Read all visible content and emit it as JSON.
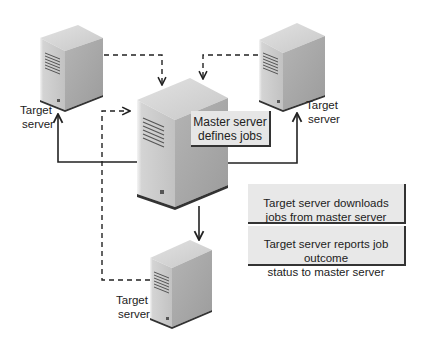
{
  "diagram": {
    "nodes": [
      {
        "id": "target-top-left",
        "label_line1": "Target",
        "label_line2": "server"
      },
      {
        "id": "target-top-right",
        "label_line1": "Target",
        "label_line2": "server"
      },
      {
        "id": "master",
        "callout_line1": "Master server",
        "callout_line2": "defines jobs"
      },
      {
        "id": "target-bottom",
        "label_line1": "Target",
        "label_line2": "server"
      }
    ],
    "edges": [
      {
        "from": "master",
        "to": "target-top-left",
        "style": "solid"
      },
      {
        "from": "master",
        "to": "target-top-right",
        "style": "solid"
      },
      {
        "from": "master",
        "to": "target-bottom",
        "style": "solid"
      },
      {
        "from": "target-top-left",
        "to": "master",
        "style": "dashed"
      },
      {
        "from": "target-top-right",
        "to": "master",
        "style": "dashed"
      },
      {
        "from": "target-bottom",
        "to": "master",
        "style": "dashed"
      }
    ],
    "legend": [
      {
        "style": "solid",
        "line1": "Target server downloads",
        "line2": "jobs from master server"
      },
      {
        "style": "dashed",
        "line1": "Target server reports job outcome",
        "line2": "status to master server"
      }
    ],
    "colors": {
      "line": "#222222",
      "server_front": "#c8c8c8",
      "server_side": "#a9a9a9",
      "server_top": "#d9d9d9",
      "legend_bg": "#e8e8e8"
    }
  }
}
